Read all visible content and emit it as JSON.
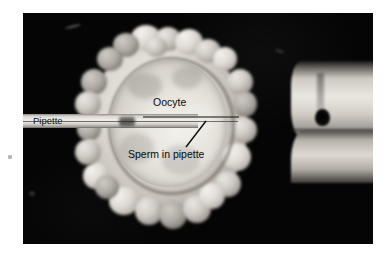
{
  "figure": {
    "type": "micrograph",
    "background_color": "#ffffff",
    "plate_color": "#030303"
  },
  "plate": {
    "x": 23,
    "y": 13,
    "width": 350,
    "height": 231
  },
  "labels": {
    "pipette": "Pipette",
    "oocyte": "Oocyte",
    "sperm": "Sperm in pipette"
  },
  "structures": {
    "cumulus_mass": "cumulus-oophorus-cell-mass",
    "oocyte_disc": "oocyte-cytoplasm",
    "injection_pipette": "injection-pipette",
    "holding_pipette": "holding-pipette",
    "leader_line": "sperm-leader-line"
  },
  "colors": {
    "plate": "#030303",
    "cell_highlight": "#f2f1ec",
    "cell_midtone": "#c2bdb6",
    "cell_shadow": "#6b6760",
    "label_text": "#0a0a0a"
  }
}
